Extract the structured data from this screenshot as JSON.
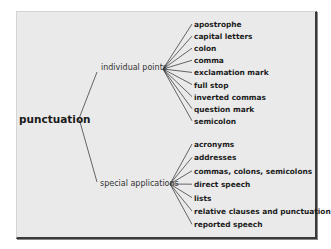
{
  "diagram": {
    "title": "punctuation",
    "colors": {
      "panel": "#eaeaea",
      "text": "#1a1a1a",
      "border": "#3a3a3a"
    },
    "branches": [
      {
        "label": "individual points",
        "items": [
          "apostrophe",
          "capital letters",
          "colon",
          "comma",
          "exclamation mark",
          "full stop",
          "inverted commas",
          "question mark",
          "semicolon"
        ]
      },
      {
        "label": "special applications",
        "items": [
          "acronyms",
          "addresses",
          "commas, colons, semicolons",
          "direct speech",
          "lists",
          "relative clauses and punctuation",
          "reported speech"
        ]
      }
    ]
  }
}
